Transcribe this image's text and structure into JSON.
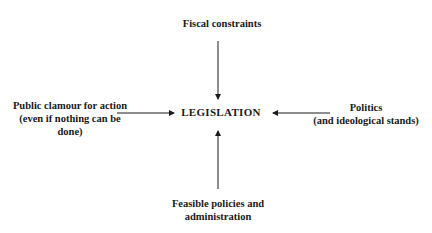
{
  "diagram": {
    "center": "LEGISLATION",
    "inputs": {
      "top": [
        "Fiscal constraints"
      ],
      "left": [
        "Public clamour for action",
        "(even if nothing can be",
        "done)"
      ],
      "right": [
        "Politics",
        "(and ideological stands)"
      ],
      "bottom": [
        "Feasible policies and",
        "administration"
      ]
    },
    "arrows": [
      {
        "from": "top",
        "to": "center"
      },
      {
        "from": "left",
        "to": "center"
      },
      {
        "from": "right",
        "to": "center"
      },
      {
        "from": "bottom",
        "to": "center"
      }
    ]
  }
}
